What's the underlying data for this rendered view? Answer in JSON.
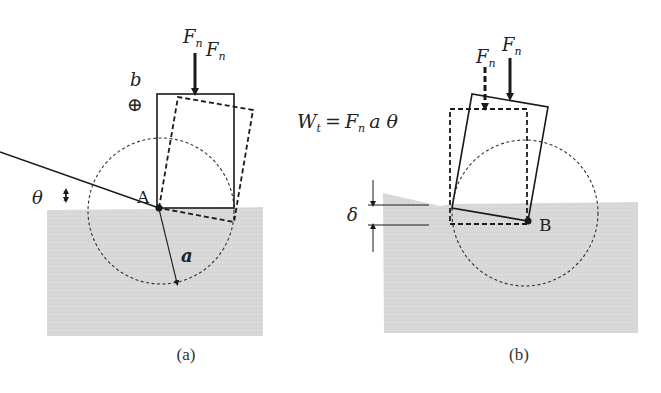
{
  "figure": {
    "colors": {
      "ground": "#d9d9d9",
      "line": "#1a1a1a",
      "background": "#ffffff"
    },
    "equation": {
      "lhs": "W",
      "lhs_sub": "t",
      "equals": "=",
      "F": "F",
      "F_sub": "n",
      "rest": "a θ"
    },
    "panel_a": {
      "caption": "(a)",
      "force_label_left": {
        "main": "F",
        "sub": "n"
      },
      "force_label_right": {
        "main": "F",
        "sub": "n"
      },
      "width_label": "b",
      "width_symbol": "⊕",
      "pivot_label": "A",
      "angle_label": "θ",
      "radius_label": "a"
    },
    "panel_b": {
      "caption": "(b)",
      "force_label_dashed": {
        "main": "F",
        "sub": "n"
      },
      "force_label_solid": {
        "main": "F",
        "sub": "n"
      },
      "pivot_label": "B",
      "displacement_label": "δ"
    }
  }
}
